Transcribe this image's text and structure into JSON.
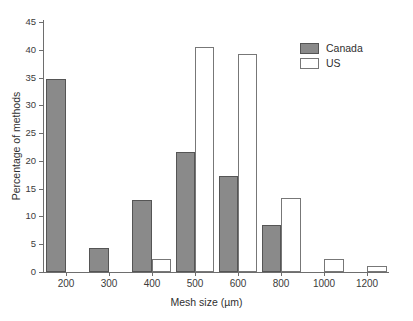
{
  "chart_data": {
    "type": "bar",
    "title": "",
    "xlabel": "Mesh size (µm)",
    "ylabel": "Percentage of methods",
    "categories": [
      "200",
      "300",
      "400",
      "500",
      "600",
      "800",
      "1000",
      "1200"
    ],
    "series": [
      {
        "name": "Canada",
        "color": "#8a8a8a",
        "values": [
          34.7,
          4.3,
          13.0,
          21.6,
          17.3,
          8.5,
          0,
          0
        ]
      },
      {
        "name": "US",
        "color": "#ffffff",
        "values": [
          0,
          0,
          2.3,
          40.5,
          39.3,
          13.4,
          2.3,
          1.1
        ]
      }
    ],
    "ylim": [
      0,
      45
    ],
    "yticks": [
      0,
      5,
      10,
      15,
      20,
      25,
      30,
      35,
      40,
      45
    ],
    "ytick_labels": [
      "0",
      "5",
      "10",
      "15",
      "20",
      "25",
      "30",
      "35",
      "40",
      "45"
    ],
    "grid": false,
    "legend_position": "top-right",
    "legend": [
      "Canada",
      "US"
    ]
  },
  "axes": {
    "x_title": "Mesh size (µm)",
    "y_title": "Percentage of methods"
  },
  "legend": {
    "items": [
      {
        "label": "Canada",
        "swatch": "filled-gray-swatch"
      },
      {
        "label": "US",
        "swatch": "white-outline-swatch"
      }
    ]
  }
}
